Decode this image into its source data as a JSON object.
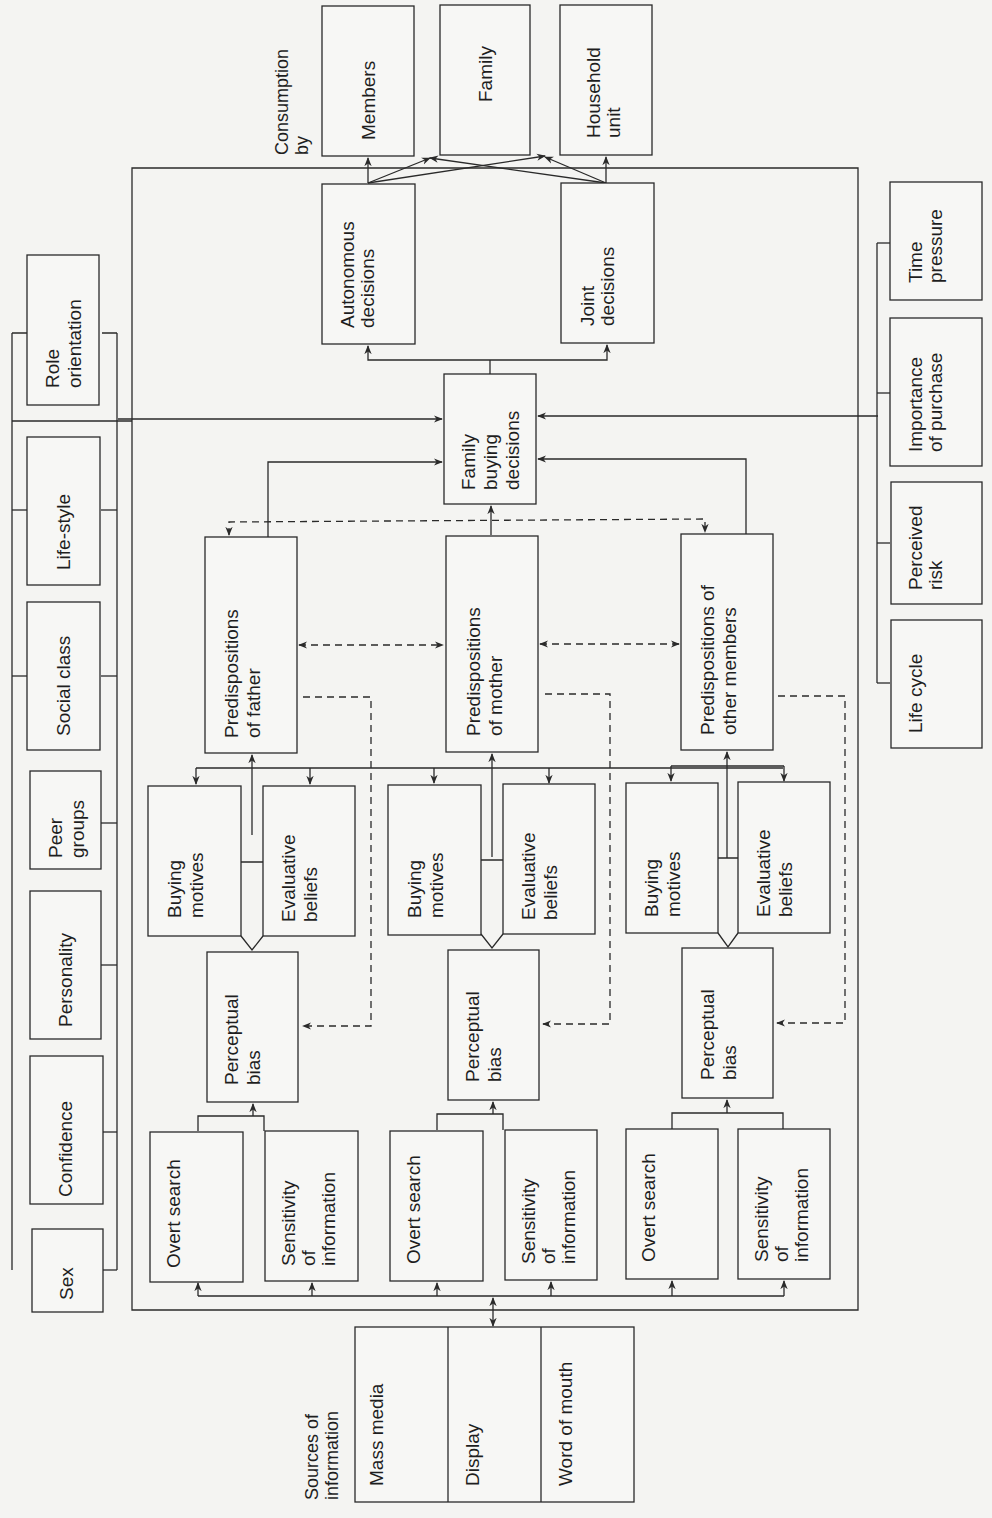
{
  "consumption": {
    "caption_l1": "Consumption",
    "caption_l2": "by",
    "members": "Members",
    "family": "Family",
    "household_l1": "Household",
    "household_l2": "unit"
  },
  "decisions": {
    "autonomous_l1": "Autonomous",
    "autonomous_l2": "decisions",
    "joint_l1": "Joint",
    "joint_l2": "decisions",
    "family_buying_l1": "Family",
    "family_buying_l2": "buying",
    "family_buying_l3": "decisions"
  },
  "left_factors": [
    {
      "l1": "Role",
      "l2": "orientation"
    },
    {
      "l1": "Life-style",
      "l2": ""
    },
    {
      "l1": "Social class",
      "l2": ""
    },
    {
      "l1": "Peer",
      "l2": "groups"
    },
    {
      "l1": "Personality",
      "l2": ""
    },
    {
      "l1": "Confidence",
      "l2": ""
    },
    {
      "l1": "Sex",
      "l2": ""
    }
  ],
  "right_factors": [
    {
      "l1": "Time",
      "l2": "pressure"
    },
    {
      "l1": "Importance",
      "l2": "of purchase"
    },
    {
      "l1": "Perceived",
      "l2": "risk"
    },
    {
      "l1": "Life cycle",
      "l2": ""
    }
  ],
  "members": [
    {
      "predispositions_l1": "Predispositions",
      "predispositions_l2": "of father",
      "buying_motives_l1": "Buying",
      "buying_motives_l2": "motives",
      "evaluative_beliefs_l1": "Evaluative",
      "evaluative_beliefs_l2": "beliefs",
      "perceptual_bias_l1": "Perceptual",
      "perceptual_bias_l2": "bias",
      "overt_search": "Overt search",
      "sensitivity_l1": "Sensitivity",
      "sensitivity_l2": "of",
      "sensitivity_l3": "information"
    },
    {
      "predispositions_l1": "Predispositions",
      "predispositions_l2": "of mother",
      "buying_motives_l1": "Buying",
      "buying_motives_l2": "motives",
      "evaluative_beliefs_l1": "Evaluative",
      "evaluative_beliefs_l2": "beliefs",
      "perceptual_bias_l1": "Perceptual",
      "perceptual_bias_l2": "bias",
      "overt_search": "Overt search",
      "sensitivity_l1": "Sensitivity",
      "sensitivity_l2": "of",
      "sensitivity_l3": "information"
    },
    {
      "predispositions_l1": "Predispositions of",
      "predispositions_l2": "other members",
      "buying_motives_l1": "Buying",
      "buying_motives_l2": "motives",
      "evaluative_beliefs_l1": "Evaluative",
      "evaluative_beliefs_l2": "beliefs",
      "perceptual_bias_l1": "Perceptual",
      "perceptual_bias_l2": "bias",
      "overt_search": "Overt search",
      "sensitivity_l1": "Sensitivity",
      "sensitivity_l2": "of",
      "sensitivity_l3": "information"
    }
  ],
  "sources": {
    "caption_l1": "Sources of",
    "caption_l2": "information",
    "mass_media": "Mass media",
    "display": "Display",
    "word_of_mouth": "Word of mouth"
  }
}
